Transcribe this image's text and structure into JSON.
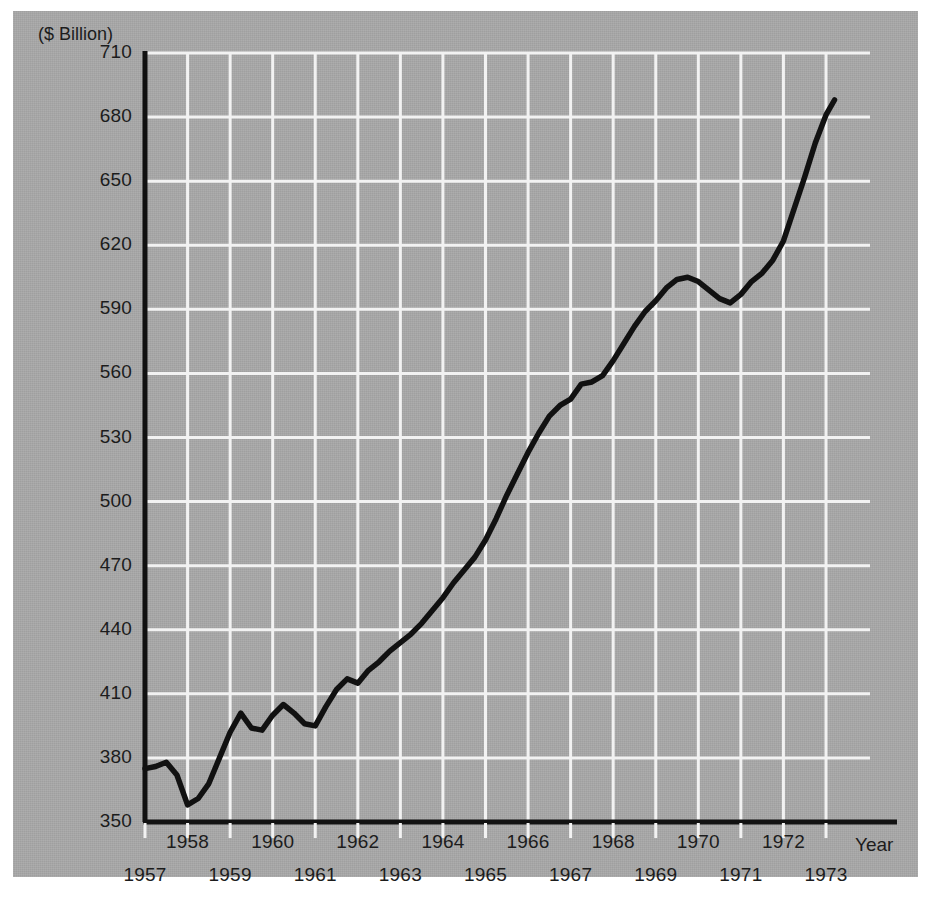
{
  "chart_data": {
    "type": "line",
    "title": "",
    "subtitle": "",
    "units_label": "($ Billion)",
    "xlabel": "Year",
    "ylabel": "",
    "ylim": [
      350,
      710
    ],
    "xlim": [
      1957,
      1973.3
    ],
    "grid": true,
    "legend": null,
    "y_ticks": [
      350,
      380,
      410,
      440,
      470,
      500,
      530,
      560,
      590,
      620,
      650,
      680,
      710
    ],
    "x_ticks": [
      1957,
      1958,
      1959,
      1960,
      1961,
      1962,
      1963,
      1964,
      1965,
      1966,
      1967,
      1968,
      1969,
      1970,
      1971,
      1972,
      1973
    ],
    "x_tick_rows": {
      "upper": [
        1958,
        1960,
        1962,
        1964,
        1966,
        1968,
        1970,
        1972
      ],
      "lower": [
        1957,
        1959,
        1961,
        1963,
        1965,
        1967,
        1969,
        1971,
        1973
      ]
    },
    "series": [
      {
        "name": "GNP",
        "color": "#111111",
        "x": [
          1957.0,
          1957.25,
          1957.5,
          1957.75,
          1958.0,
          1958.25,
          1958.5,
          1958.75,
          1959.0,
          1959.25,
          1959.5,
          1959.75,
          1960.0,
          1960.25,
          1960.5,
          1960.75,
          1961.0,
          1961.25,
          1961.5,
          1961.75,
          1962.0,
          1962.25,
          1962.5,
          1962.75,
          1963.0,
          1963.25,
          1963.5,
          1963.75,
          1964.0,
          1964.25,
          1964.5,
          1964.75,
          1965.0,
          1965.25,
          1965.5,
          1965.75,
          1966.0,
          1966.25,
          1966.5,
          1966.75,
          1967.0,
          1967.25,
          1967.5,
          1967.75,
          1968.0,
          1968.25,
          1968.5,
          1968.75,
          1969.0,
          1969.25,
          1969.5,
          1969.75,
          1970.0,
          1970.25,
          1970.5,
          1970.75,
          1971.0,
          1971.25,
          1971.5,
          1971.75,
          1972.0,
          1972.25,
          1972.5,
          1972.75,
          1973.0,
          1973.2
        ],
        "y": [
          375,
          376,
          378,
          372,
          358,
          361,
          368,
          380,
          392,
          401,
          394,
          393,
          400,
          405,
          401,
          396,
          395,
          404,
          412,
          417,
          415,
          421,
          425,
          430,
          434,
          438,
          443,
          449,
          455,
          462,
          468,
          474,
          482,
          492,
          503,
          513,
          523,
          532,
          540,
          545,
          548,
          555,
          556,
          559,
          566,
          574,
          582,
          589,
          594,
          600,
          604,
          605,
          603,
          599,
          595,
          593,
          597,
          603,
          607,
          613,
          622,
          637,
          652,
          668,
          681,
          688
        ]
      }
    ]
  }
}
